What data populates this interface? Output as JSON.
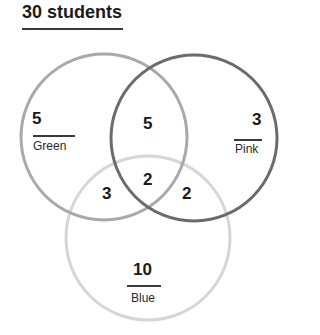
{
  "title": "30 students",
  "sets": {
    "green": {
      "label": "Green",
      "only": "5",
      "color": "#a9a9a9"
    },
    "pink": {
      "label": "Pink",
      "only": "3",
      "color": "#6b6b6b"
    },
    "blue": {
      "label": "Blue",
      "only": "10",
      "color": "#d6d6d6"
    }
  },
  "intersections": {
    "green_pink": "5",
    "green_blue": "3",
    "pink_blue": "2",
    "all": "2"
  }
}
